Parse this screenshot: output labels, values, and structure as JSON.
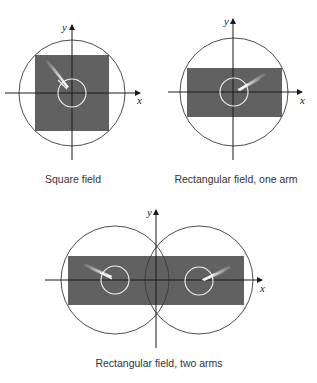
{
  "colors": {
    "background": "#ffffff",
    "field_fill": "#616161",
    "axis": "#1a1a1a",
    "outer_circle": "#3a3a3a",
    "inner_circle": "#f2f2f2",
    "beam": "#ffffff",
    "caption": "#333333"
  },
  "diagrams": [
    {
      "id": "square-field",
      "caption": "Square field",
      "x_label": "x",
      "y_label": "y",
      "field_shape": "square",
      "arms": 1,
      "beam_direction": "upper-left"
    },
    {
      "id": "rectangular-one-arm",
      "caption": "Rectangular field, one arm",
      "x_label": "x",
      "y_label": "y",
      "field_shape": "rectangle",
      "arms": 1,
      "beam_direction": "upper-right"
    },
    {
      "id": "rectangular-two-arms",
      "caption": "Rectangular field, two arms",
      "x_label": "x",
      "y_label": "y",
      "field_shape": "rectangle",
      "arms": 2,
      "beam_direction": "left arm upper-left, right arm upper-right"
    }
  ]
}
